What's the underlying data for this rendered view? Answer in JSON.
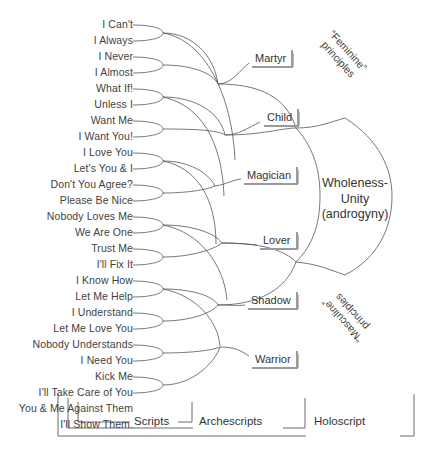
{
  "diagram": {
    "scripts": [
      "I Can't",
      "I Always",
      "I Never",
      "I Almost",
      "What If!",
      "Unless I",
      "Want Me",
      "I Want You!",
      "I Love You",
      "Let's You & I",
      "Don't You Agree?",
      "Please Be Nice",
      "Nobody Loves Me",
      "We Are One",
      "Trust Me",
      "I'll Fix It",
      "I Know How",
      "Let Me Help",
      "I Understand",
      "Let Me Love You",
      "Nobody Understands",
      "I Need You",
      "Kick Me",
      "I'll Take Care of You",
      "You & Me Against Them",
      "I'll Show Them!"
    ],
    "archetypes": [
      {
        "label": "Martyr",
        "x": 250,
        "y": 50
      },
      {
        "label": "Child",
        "x": 262,
        "y": 109
      },
      {
        "label": "Magician",
        "x": 242,
        "y": 167
      },
      {
        "label": "Lover",
        "x": 258,
        "y": 232
      },
      {
        "label": "Shadow",
        "x": 246,
        "y": 292
      },
      {
        "label": "Warrior",
        "x": 250,
        "y": 351
      }
    ],
    "center": {
      "line1": "Wholeness-",
      "line2": "Unity",
      "line3": "(androgyny)"
    },
    "principles": {
      "feminine_quote": "“Feminine”",
      "feminine_word": "principles",
      "masculine_quote": "“Masculine”",
      "masculine_word": "principles"
    },
    "brackets": [
      {
        "label": "Scripts"
      },
      {
        "label": "Archescripts"
      },
      {
        "label": "Holoscript"
      }
    ],
    "colors": {
      "background": "#ffffff",
      "text": "#3a3a3a",
      "line": "#555555",
      "shadow": "#b5b5b5"
    }
  }
}
